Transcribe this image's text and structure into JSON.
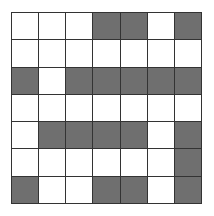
{
  "grid": {
    "rows": 7,
    "cols": 7,
    "fill_color": "#6f6f6f",
    "empty_color": "#ffffff",
    "line_color": "#333333",
    "cells": [
      [
        0,
        0,
        0,
        1,
        1,
        0,
        1
      ],
      [
        0,
        0,
        0,
        0,
        0,
        0,
        0
      ],
      [
        1,
        0,
        1,
        1,
        1,
        1,
        1
      ],
      [
        0,
        0,
        0,
        0,
        0,
        0,
        0
      ],
      [
        0,
        1,
        1,
        1,
        1,
        0,
        1
      ],
      [
        0,
        0,
        0,
        0,
        0,
        0,
        1
      ],
      [
        1,
        0,
        0,
        1,
        1,
        0,
        1
      ]
    ]
  }
}
